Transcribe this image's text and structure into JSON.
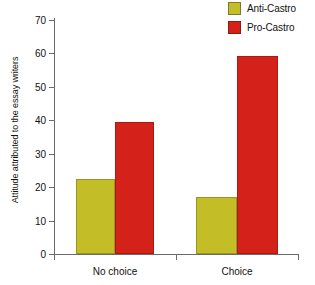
{
  "chart_data": {
    "type": "bar",
    "title": "",
    "xlabel": "",
    "ylabel": "Attitude attributed to the essay writers",
    "categories": [
      "No choice",
      "Choice"
    ],
    "series": [
      {
        "name": "Anti-Castro",
        "color": "#c3bd28",
        "values": [
          22.5,
          17.0
        ]
      },
      {
        "name": "Pro-Castro",
        "color": "#d4221a",
        "values": [
          39.5,
          59.3
        ]
      }
    ],
    "ylim": [
      0,
      70
    ],
    "yticks": [
      0,
      10,
      20,
      30,
      40,
      50,
      60,
      70
    ],
    "ytick_labels": [
      "0",
      "10",
      "20",
      "30",
      "40",
      "50",
      "60",
      "70"
    ],
    "grid": false,
    "legend_position": "top-right"
  },
  "legend": {
    "items": [
      {
        "label": "Anti-Castro",
        "color": "#c3bd28"
      },
      {
        "label": "Pro-Castro",
        "color": "#d4221a"
      }
    ]
  },
  "axes": {
    "y_axis_title": "Attitude attributed to the essay writers",
    "y_ticks": [
      "70",
      "60",
      "50",
      "40",
      "30",
      "20",
      "10",
      "0"
    ],
    "x_ticks": [
      "No choice",
      "Choice"
    ]
  }
}
